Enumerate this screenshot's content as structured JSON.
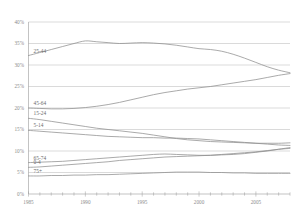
{
  "chart_data": {
    "type": "line",
    "title": "",
    "subtitle": "",
    "xlabel": "",
    "ylabel": "",
    "xlim": [
      1985,
      2008
    ],
    "ylim": [
      0,
      40
    ],
    "y_tick_labels": [
      "40%",
      "35%",
      "30%",
      "25%",
      "20%",
      "15%",
      "10%",
      "5%",
      "0%"
    ],
    "y_tick_values": [
      40,
      35,
      30,
      25,
      20,
      15,
      10,
      5,
      0
    ],
    "x_tick_labels": [
      "1985",
      "1990",
      "1995",
      "2000",
      "2005"
    ],
    "x_tick_values": [
      1985,
      1990,
      1995,
      2000,
      2005
    ],
    "x_minor_ticks": [
      1985,
      1986,
      1987,
      1988,
      1989,
      1990,
      1991,
      1992,
      1993,
      1994,
      1995,
      1996,
      1997,
      1998,
      1999,
      2000,
      2001,
      2002,
      2003,
      2004,
      2005,
      2006,
      2007,
      2008
    ],
    "grid": true,
    "legend_position": "inline-left",
    "x": [
      1985,
      1986,
      1987,
      1988,
      1989,
      1990,
      1991,
      1992,
      1993,
      1994,
      1995,
      1996,
      1997,
      1998,
      1999,
      2000,
      2001,
      2002,
      2003,
      2004,
      2005,
      2006,
      2007,
      2008
    ],
    "series": [
      {
        "name": "25-44",
        "label": "25-44",
        "values": [
          32.2,
          32.9,
          33.6,
          34.3,
          35.0,
          35.6,
          35.4,
          35.2,
          35.0,
          35.1,
          35.2,
          35.1,
          34.9,
          34.6,
          34.2,
          33.8,
          33.6,
          33.2,
          32.5,
          31.6,
          30.6,
          29.6,
          28.8,
          28.2
        ]
      },
      {
        "name": "45-64",
        "label": "45-64",
        "values": [
          20.0,
          19.9,
          19.8,
          19.8,
          19.9,
          20.1,
          20.4,
          20.8,
          21.3,
          21.9,
          22.5,
          23.1,
          23.6,
          24.0,
          24.4,
          24.7,
          25.0,
          25.4,
          25.8,
          26.2,
          26.6,
          27.1,
          27.6,
          28.0
        ]
      },
      {
        "name": "15-24",
        "label": "15-24",
        "values": [
          17.6,
          17.3,
          16.9,
          16.5,
          16.1,
          15.7,
          15.3,
          15.0,
          14.7,
          14.4,
          14.1,
          13.7,
          13.3,
          12.9,
          12.6,
          12.4,
          12.2,
          12.1,
          12.0,
          11.9,
          11.8,
          11.8,
          11.8,
          11.9
        ]
      },
      {
        "name": "5-14",
        "label": "5-14",
        "values": [
          14.8,
          14.6,
          14.4,
          14.2,
          14.0,
          13.8,
          13.6,
          13.4,
          13.3,
          13.2,
          13.1,
          13.1,
          13.0,
          13.0,
          12.9,
          12.8,
          12.6,
          12.4,
          12.2,
          12.0,
          11.8,
          11.6,
          11.4,
          11.3
        ]
      },
      {
        "name": "65-74",
        "label": "65-74",
        "values": [
          7.3,
          7.4,
          7.5,
          7.6,
          7.8,
          8.0,
          8.2,
          8.4,
          8.6,
          8.8,
          9.0,
          9.2,
          9.3,
          9.2,
          9.1,
          9.0,
          9.0,
          9.1,
          9.2,
          9.4,
          9.7,
          10.0,
          10.4,
          10.8
        ]
      },
      {
        "name": "0-4",
        "label": "0-4",
        "values": [
          6.2,
          6.3,
          6.5,
          6.7,
          6.9,
          7.1,
          7.3,
          7.5,
          7.8,
          8.0,
          8.2,
          8.4,
          8.6,
          8.7,
          8.8,
          8.9,
          9.0,
          9.2,
          9.4,
          9.6,
          9.8,
          10.1,
          10.4,
          10.6
        ]
      },
      {
        "name": "75+",
        "label": "75+",
        "values": [
          4.2,
          4.2,
          4.3,
          4.3,
          4.4,
          4.4,
          4.5,
          4.5,
          4.6,
          4.7,
          4.8,
          4.9,
          5.0,
          5.1,
          5.1,
          5.1,
          5.0,
          5.0,
          4.9,
          4.9,
          4.8,
          4.8,
          4.8,
          4.8
        ]
      }
    ]
  },
  "colors": {
    "line": "#8e8e8e",
    "grid": "#b4b4b4",
    "axis": "#9a9a9a",
    "tick_text": "#8a8a8a",
    "label_text": "#6b6b6b",
    "background": "#ffffff"
  }
}
